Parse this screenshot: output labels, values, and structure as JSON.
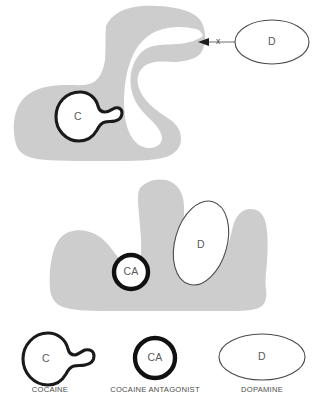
{
  "figure": {
    "type": "diagram",
    "background_color": "#ffffff",
    "receptor_fill_color": "#cdcdcd",
    "ligand_outline_color": "#1a1a1a",
    "dopamine_outline_color": "#4a4a4a"
  },
  "panels": {
    "top": {
      "name": "cocaine-blocks-dopamine",
      "receptor_label": "",
      "bound_ligand": {
        "glyph": "C",
        "name": "cocaine-molecule",
        "position": "left notch of receptor"
      },
      "free_ligand": {
        "glyph": "D",
        "name": "dopamine-molecule",
        "position": "right of receptor, outside"
      },
      "annotation": {
        "block_marker": "x",
        "meaning": "dopamine blocked from binding site",
        "arrow_direction": "left"
      }
    },
    "bottom": {
      "name": "antagonist-allows-dopamine",
      "bound_antagonist": {
        "glyph": "CA",
        "name": "cocaine-antagonist-molecule",
        "position": "left notch of receptor"
      },
      "bound_dopamine": {
        "glyph": "D",
        "name": "dopamine-molecule",
        "position": "right cleft of receptor"
      }
    }
  },
  "legend": {
    "name": "figure-legend",
    "items": [
      {
        "glyph": "C",
        "caption": "COCAINE",
        "shape": "circle-with-tail"
      },
      {
        "glyph": "CA",
        "caption": "COCAINE ANTAGONIST",
        "shape": "thick-ring"
      },
      {
        "glyph": "D",
        "caption": "DOPAMINE",
        "shape": "ellipse"
      }
    ]
  }
}
